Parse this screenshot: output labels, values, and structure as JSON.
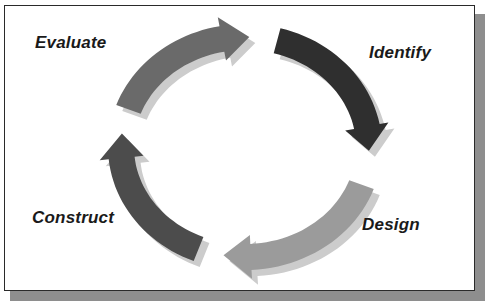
{
  "diagram": {
    "type": "cycle",
    "direction": "clockwise",
    "stages": [
      {
        "id": "evaluate",
        "label": "Evaluate",
        "arrow_color": "#6a6a6a",
        "next": "identify"
      },
      {
        "id": "identify",
        "label": "Identify",
        "arrow_color": "#2f2f2f",
        "next": "design"
      },
      {
        "id": "design",
        "label": "Design",
        "arrow_color": "#9b9b9b",
        "next": "construct"
      },
      {
        "id": "construct",
        "label": "Construct",
        "arrow_color": "#4c4c4c",
        "next": "evaluate"
      }
    ],
    "shadow_color": "#cccccc",
    "frame_border_color": "#2a2a2a",
    "frame_shadow_color": "#8e8e8e"
  }
}
